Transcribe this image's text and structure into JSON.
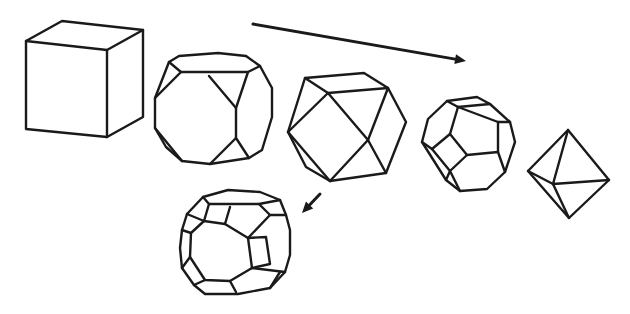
{
  "diagram": {
    "background": "#ffffff",
    "stroke_color": "#1a1a1a",
    "shapes": [
      {
        "name": "cube",
        "polylines": [
          "26,41 62,21 143,30 143,117 107,137 26,129 26,41",
          "26,41 107,50 143,30",
          "107,50 107,137"
        ]
      },
      {
        "name": "truncated-cube",
        "polylines": [
          "169,62 179,56 218,53 246,56 260,66 272,88 272,117 262,150 249,158 210,164 182,161 166,147 155,128 155,98 169,62",
          "169,62 181,72 248,72 260,66",
          "181,72 155,98",
          "248,72 236,108 236,138 249,158",
          "209,76 236,108",
          "236,138 210,164",
          "155,128 182,161"
        ]
      },
      {
        "name": "cuboctahedron",
        "polylines": [
          "305,78 364,73 388,88 406,122 386,173 330,181 306,167 288,132 305,78",
          "305,78 328,93 388,88",
          "328,93 288,132",
          "328,93 368,140 386,173",
          "388,88 368,140",
          "368,140 330,181",
          "288,132 330,181"
        ]
      },
      {
        "name": "truncated-octahedron",
        "polylines": [
          "447,101 477,97 490,104 510,122 515,142 505,172 487,189 460,191 446,180 422,142 428,119 447,101",
          "447,101 458,107 490,104",
          "458,107 450,134 432,149",
          "458,107 498,122 510,122",
          "450,134 467,155 498,152 505,172",
          "467,155 450,171 460,191",
          "498,122 498,152",
          "422,142 432,149 450,171 446,180"
        ]
      },
      {
        "name": "octahedron",
        "polylines": [
          "568,130 609,180 569,218 528,171 568,130",
          "568,130 553,184 609,180",
          "553,184 569,218",
          "528,171 553,184"
        ]
      },
      {
        "name": "truncated-cuboctahedron",
        "polylines": [
          "203,197 228,190 260,192 280,200 286,215 290,230 290,255 285,272 270,288 238,294 205,294 194,285 182,268 180,248 182,230 187,214 203,197",
          "203,197 209,204 259,204 280,200",
          "209,204 204,221 225,224 230,207",
          "187,214 204,221",
          "259,204 270,215 286,215",
          "270,215 248,238 252,268 285,272",
          "248,238 266,237 270,264 252,268",
          "225,224 248,238",
          "182,230 191,233 190,257 182,268",
          "190,257 205,280 230,281 236,292",
          "191,233 204,221",
          "230,281 252,268",
          "205,280 194,285",
          "270,288 280,272"
        ]
      }
    ],
    "arrows": [
      {
        "name": "sequence-arrow",
        "x1": 253,
        "y1": 24,
        "x2": 466,
        "y2": 61
      },
      {
        "name": "branch-arrow",
        "x1": 320,
        "y1": 194,
        "x2": 302,
        "y2": 213
      }
    ]
  }
}
